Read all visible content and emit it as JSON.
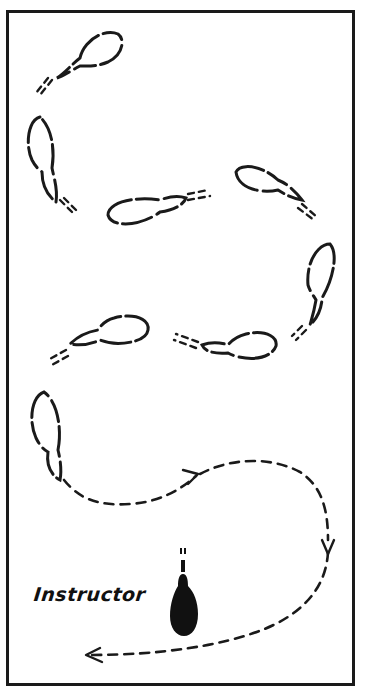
{
  "diagram": {
    "type": "movement-path",
    "frame": {
      "border_color": "#1a1a1a",
      "background": "#ffffff"
    },
    "labels": {
      "instructor": "Instructor"
    },
    "elements": {
      "footprints": [
        {
          "id": 1,
          "position": "top-left",
          "orientation": "pointing up-right"
        },
        {
          "id": 2,
          "position": "left upper",
          "orientation": "pointing down"
        },
        {
          "id": 3,
          "position": "center",
          "orientation": "pointing left"
        },
        {
          "id": 4,
          "position": "right upper",
          "orientation": "pointing left"
        },
        {
          "id": 5,
          "position": "right middle",
          "orientation": "pointing up"
        },
        {
          "id": 6,
          "position": "center right",
          "orientation": "pointing right"
        },
        {
          "id": 7,
          "position": "left middle",
          "orientation": "pointing right"
        },
        {
          "id": 8,
          "position": "left lower",
          "orientation": "pointing up"
        }
      ],
      "return_path": {
        "style": "dashed",
        "arrows": [
          "right (mid)",
          "down (right side)",
          "left (bottom)"
        ]
      },
      "instructor_figure": {
        "fill": "#111111",
        "position": "bottom center"
      }
    }
  }
}
